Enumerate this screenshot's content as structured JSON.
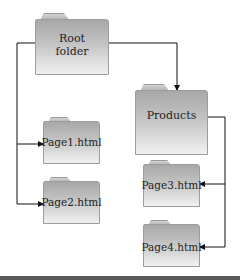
{
  "diagram": {
    "title": "",
    "nodes": [
      {
        "id": "root",
        "label_lines": [
          "Root",
          "folder"
        ],
        "type": "folder"
      },
      {
        "id": "products",
        "label_lines": [
          "Products"
        ],
        "type": "folder"
      },
      {
        "id": "page1",
        "label_lines": [
          "Page1.html"
        ],
        "type": "file"
      },
      {
        "id": "page2",
        "label_lines": [
          "Page2.html"
        ],
        "type": "file"
      },
      {
        "id": "page3",
        "label_lines": [
          "Page3.html"
        ],
        "type": "file"
      },
      {
        "id": "page4",
        "label_lines": [
          "Page4.html"
        ],
        "type": "file"
      }
    ],
    "edges": [
      {
        "from": "root",
        "to": "products"
      },
      {
        "from": "root",
        "to": "page1"
      },
      {
        "from": "root",
        "to": "page2"
      },
      {
        "from": "products",
        "to": "page3"
      },
      {
        "from": "products",
        "to": "page4"
      }
    ],
    "colors": {
      "connector": "#111111",
      "folder_top": "#a8a8a8",
      "folder_bottom": "#f1f1f1",
      "bottom_bar": "#5a5a5a"
    }
  }
}
